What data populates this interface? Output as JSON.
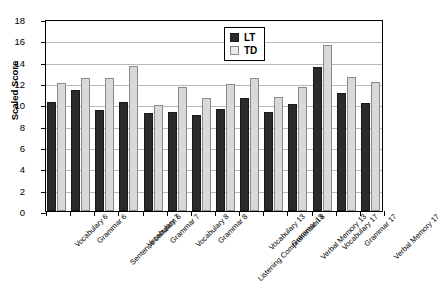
{
  "chart_data": {
    "type": "bar",
    "title": "",
    "xlabel": "",
    "ylabel": "Scaled Score",
    "ylim": [
      0,
      18
    ],
    "ytick_step": 2,
    "yticks": [
      0,
      2,
      4,
      6,
      8,
      10,
      12,
      14,
      16,
      18
    ],
    "grid": true,
    "legend_position": "top-right-inside",
    "categories": [
      "Vocabulary 6",
      "Grammar 6",
      "Sentence Imitation 6",
      "Vocabulary 7",
      "Grammar 7",
      "Vocabulary 8",
      "Grammar 8",
      "Listening Comprehension 8",
      "Vocabulary 13",
      "Grammar 13",
      "Verbal Memory 13",
      "Vocabulary 17",
      "Grammar 17",
      "Verbal Memory 17"
    ],
    "series": [
      {
        "name": "LT",
        "color": "#2b2b2b",
        "values": [
          10.2,
          11.3,
          9.5,
          10.2,
          9.2,
          9.3,
          9.0,
          9.6,
          10.6,
          9.3,
          10.0,
          13.5,
          11.1,
          10.1
        ]
      },
      {
        "name": "TD",
        "color": "#d9d9d9",
        "values": [
          12.0,
          12.5,
          12.5,
          13.6,
          9.9,
          11.6,
          10.6,
          11.9,
          12.5,
          10.7,
          11.6,
          15.6,
          12.6,
          12.1
        ]
      }
    ]
  },
  "legend": {
    "items": [
      {
        "label": "LT",
        "swatch": "dark-swatch"
      },
      {
        "label": "TD",
        "swatch": "light-swatch"
      }
    ]
  }
}
